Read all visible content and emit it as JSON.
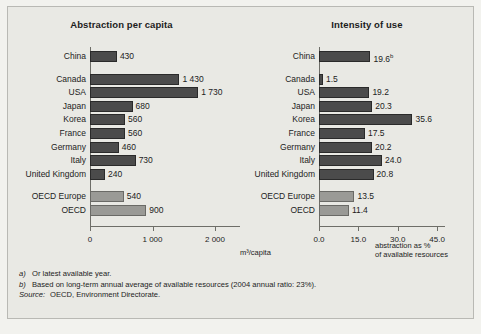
{
  "chart_data": [
    {
      "type": "bar",
      "orientation": "horizontal",
      "title": "Abstraction per capita",
      "xlabel": "m³/capita",
      "ylabel": "",
      "xlim": [
        0,
        2400
      ],
      "xticks": [
        0,
        1000,
        2000
      ],
      "xticklabels": [
        "0",
        "1 000",
        "2 000"
      ],
      "grid": false,
      "legend": "none",
      "categories": [
        "China",
        "Canada",
        "USA",
        "Japan",
        "Korea",
        "France",
        "Germany",
        "Italy",
        "United Kingdom",
        "OECD Europe",
        "OECD"
      ],
      "values": [
        430,
        1430,
        1730,
        680,
        560,
        560,
        460,
        730,
        240,
        540,
        900
      ],
      "value_labels": [
        "430",
        "1 430",
        "1 730",
        "680",
        "560",
        "560",
        "460",
        "730",
        "240",
        "540",
        "900"
      ],
      "aggregate_rows": [
        "OECD Europe",
        "OECD"
      ],
      "gap_after": [
        "China",
        "United Kingdom"
      ]
    },
    {
      "type": "bar",
      "orientation": "horizontal",
      "title": "Intensity of use",
      "xlabel": "abstraction as % of available resources",
      "ylabel": "",
      "xlim": [
        0,
        48
      ],
      "xticks": [
        0,
        15,
        30,
        45
      ],
      "xticklabels": [
        "0.0",
        "15.0",
        "30.0",
        "45.0"
      ],
      "grid": false,
      "legend": "none",
      "categories": [
        "China",
        "Canada",
        "USA",
        "Japan",
        "Korea",
        "France",
        "Germany",
        "Italy",
        "United Kingdom",
        "OECD Europe",
        "OECD"
      ],
      "values": [
        19.6,
        1.5,
        19.2,
        20.3,
        35.6,
        17.5,
        20.2,
        24.0,
        20.8,
        13.5,
        11.4
      ],
      "value_labels": [
        "19.6",
        "1.5",
        "19.2",
        "20.3",
        "35.6",
        "17.5",
        "20.2",
        "24.0",
        "20.8",
        "13.5",
        "11.4"
      ],
      "value_superscripts": [
        "b",
        "",
        "",
        "",
        "",
        "",
        "",
        "",
        "",
        "",
        ""
      ],
      "aggregate_rows": [
        "OECD Europe",
        "OECD"
      ],
      "gap_after": [
        "China",
        "United Kingdom"
      ]
    }
  ],
  "left": {
    "title": "Abstraction per capita",
    "axis_caption": "m³/capita",
    "ticks": [
      {
        "label": "0",
        "value": 0
      },
      {
        "label": "1 000",
        "value": 1000
      },
      {
        "label": "2 000",
        "value": 2000
      }
    ],
    "rows": [
      {
        "label": "China",
        "value": 430,
        "text": "430",
        "sup": "",
        "agg": false
      },
      {
        "label": "Canada",
        "value": 1430,
        "text": "1 430",
        "sup": "",
        "agg": false
      },
      {
        "label": "USA",
        "value": 1730,
        "text": "1 730",
        "sup": "",
        "agg": false
      },
      {
        "label": "Japan",
        "value": 680,
        "text": "680",
        "sup": "",
        "agg": false
      },
      {
        "label": "Korea",
        "value": 560,
        "text": "560",
        "sup": "",
        "agg": false
      },
      {
        "label": "France",
        "value": 560,
        "text": "560",
        "sup": "",
        "agg": false
      },
      {
        "label": "Germany",
        "value": 460,
        "text": "460",
        "sup": "",
        "agg": false
      },
      {
        "label": "Italy",
        "value": 730,
        "text": "730",
        "sup": "",
        "agg": false
      },
      {
        "label": "United Kingdom",
        "value": 240,
        "text": "240",
        "sup": "",
        "agg": false
      },
      {
        "label": "OECD Europe",
        "value": 540,
        "text": "540",
        "sup": "",
        "agg": true
      },
      {
        "label": "OECD",
        "value": 900,
        "text": "900",
        "sup": "",
        "agg": true
      }
    ]
  },
  "right": {
    "title": "Intensity of use",
    "axis_caption_line1": "abstraction as %",
    "axis_caption_line2": "of available resources",
    "ticks": [
      {
        "label": "0.0",
        "value": 0
      },
      {
        "label": "15.0",
        "value": 15
      },
      {
        "label": "30.0",
        "value": 30
      },
      {
        "label": "45.0",
        "value": 45
      }
    ],
    "rows": [
      {
        "label": "China",
        "value": 19.6,
        "text": "19.6",
        "sup": "b",
        "agg": false
      },
      {
        "label": "Canada",
        "value": 1.5,
        "text": "1.5",
        "sup": "",
        "agg": false
      },
      {
        "label": "USA",
        "value": 19.2,
        "text": "19.2",
        "sup": "",
        "agg": false
      },
      {
        "label": "Japan",
        "value": 20.3,
        "text": "20.3",
        "sup": "",
        "agg": false
      },
      {
        "label": "Korea",
        "value": 35.6,
        "text": "35.6",
        "sup": "",
        "agg": false
      },
      {
        "label": "France",
        "value": 17.5,
        "text": "17.5",
        "sup": "",
        "agg": false
      },
      {
        "label": "Germany",
        "value": 20.2,
        "text": "20.2",
        "sup": "",
        "agg": false
      },
      {
        "label": "Italy",
        "value": 24.0,
        "text": "24.0",
        "sup": "",
        "agg": false
      },
      {
        "label": "United Kingdom",
        "value": 20.8,
        "text": "20.8",
        "sup": "",
        "agg": false
      },
      {
        "label": "OECD Europe",
        "value": 13.5,
        "text": "13.5",
        "sup": "",
        "agg": true
      },
      {
        "label": "OECD",
        "value": 11.4,
        "text": "11.4",
        "sup": "",
        "agg": true
      }
    ]
  },
  "notes": {
    "a_mark": "a)",
    "a_text": "Or latest available year.",
    "b_mark": "b)",
    "b_text": "Based on long-term annual average of available resources (2004 annual ratio: 23%).",
    "source_mark": "Source:",
    "source_text": "OECD, Environment Directorate."
  },
  "colors": {
    "background": "#e9e9e4",
    "bar_country": "#4b4b4b",
    "bar_aggregate": "#9a9a96",
    "axis": "#6e6e68",
    "text": "#1c1c1c"
  }
}
